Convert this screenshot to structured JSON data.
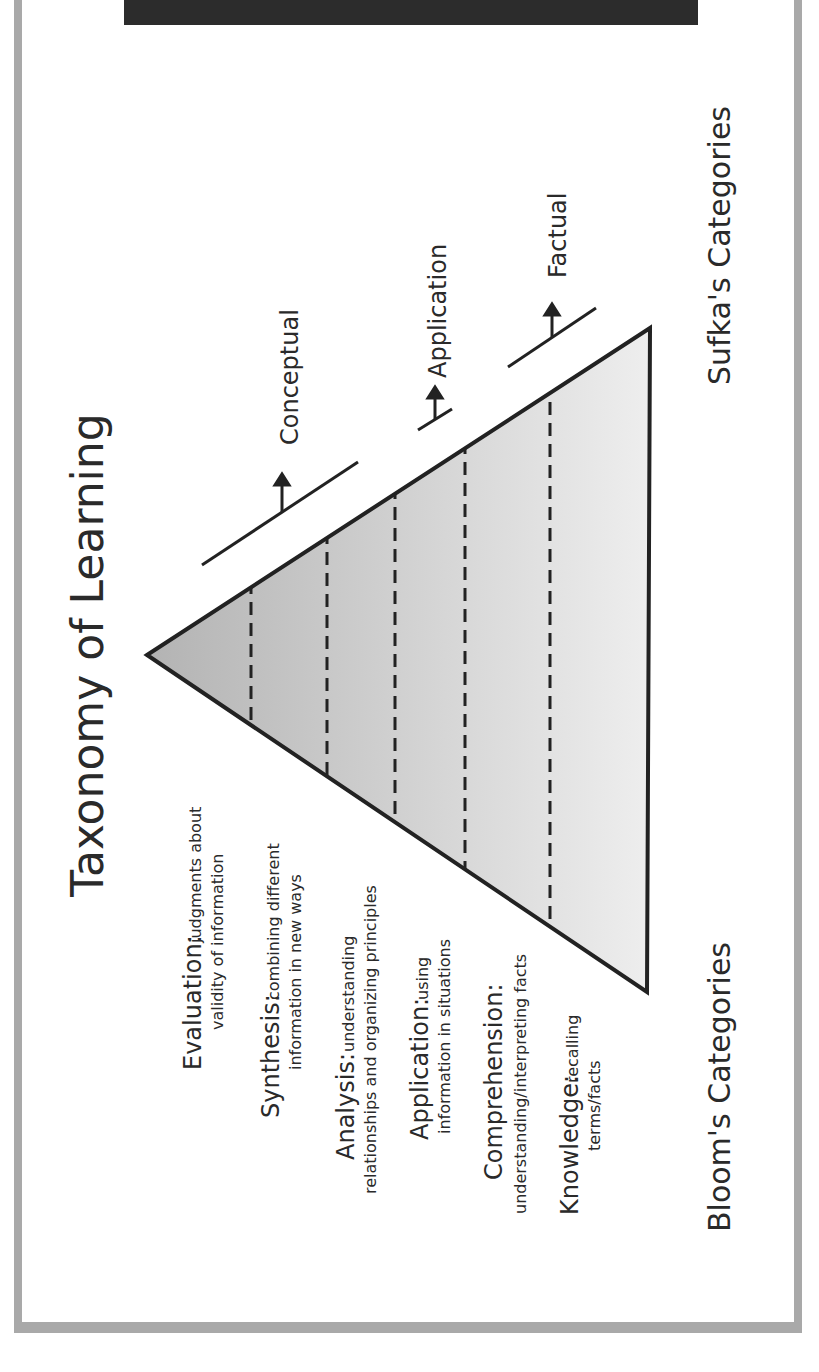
{
  "title": "Taxonomy of Learning",
  "left_axis_label": "Bloom's Categories",
  "right_axis_label": "Sufka's Categories",
  "colors": {
    "frame": "#a9a9a9",
    "header_bar": "#2c2c2c",
    "triangle_top": "#b5b5b5",
    "triangle_bottom": "#ececec",
    "stroke": "#222222",
    "text": "#2a2a2a"
  },
  "blooms_categories": [
    {
      "name": "Evaluation:",
      "desc_line1": "judgments about",
      "desc_line2": "validity of information"
    },
    {
      "name": "Synthesis:",
      "desc_line1": "combining different",
      "desc_line2": "information in new ways"
    },
    {
      "name": "Analysis:",
      "desc_line1": "understanding",
      "desc_line2": "relationships and organizing principles"
    },
    {
      "name": "Application:",
      "desc_line1": "using",
      "desc_line2": "information in situations"
    },
    {
      "name": "Comprehension:",
      "desc_line1": "",
      "desc_line2": "understanding/interpreting facts"
    },
    {
      "name": "Knowledge:",
      "desc_line1": "recalling",
      "desc_line2": "terms/facts"
    }
  ],
  "sufkas_categories": [
    {
      "label": "Conceptual"
    },
    {
      "label": "Application"
    },
    {
      "label": "Factual"
    }
  ]
}
